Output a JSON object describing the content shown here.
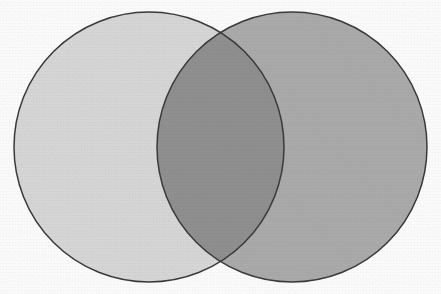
{
  "figure": {
    "kind": "venn-diagram",
    "title": "",
    "width": 441,
    "height": 294,
    "background_color": "#fbfbfb",
    "stroke_color": "#3a3a3a",
    "stroke_width": 1.5,
    "texture": "paper-grain"
  },
  "sets": [
    {
      "id": "set-left",
      "label": "",
      "fill_color": "#d6d6d6",
      "center_x": 149,
      "center_y": 147,
      "radius": 135
    },
    {
      "id": "set-right",
      "label": "",
      "fill_color": "#aaaaaa",
      "center_x": 292,
      "center_y": 147,
      "radius": 135
    }
  ],
  "intersection": {
    "id": "set-intersection",
    "label": "",
    "fill_color": "#8f8f8f",
    "crossing_points": [
      {
        "x": 221,
        "y": 38
      },
      {
        "x": 221,
        "y": 258
      }
    ]
  },
  "chart_data": {
    "type": "venn",
    "title": "",
    "subtitle": "",
    "xlabel": "",
    "ylabel": "",
    "grid": false,
    "legend": "none",
    "annotations": [],
    "set_labels": [
      "",
      ""
    ],
    "region_labels": [
      "",
      "",
      ""
    ],
    "regions": [
      {
        "name": "left-only",
        "fill": "#d6d6d6"
      },
      {
        "name": "intersection",
        "fill": "#8f8f8f"
      },
      {
        "name": "right-only",
        "fill": "#aaaaaa"
      }
    ]
  }
}
